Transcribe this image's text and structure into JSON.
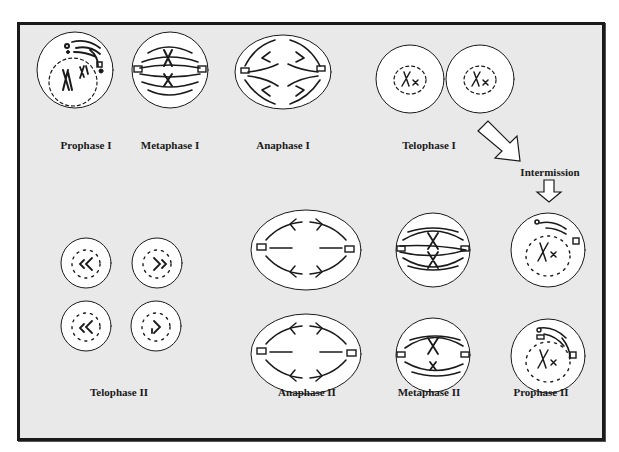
{
  "diagram": {
    "type": "process flow",
    "stages": [
      {
        "id": "prophase-1",
        "label": "Prophase I"
      },
      {
        "id": "metaphase-1",
        "label": "Metaphase I"
      },
      {
        "id": "anaphase-1",
        "label": "Anaphase I"
      },
      {
        "id": "telophase-1",
        "label": "Telophase I"
      },
      {
        "id": "intermission",
        "label": "Intermission"
      },
      {
        "id": "prophase-2",
        "label": "Prophase II"
      },
      {
        "id": "metaphase-2",
        "label": "Metaphase II"
      },
      {
        "id": "anaphase-2",
        "label": "Anaphase II"
      },
      {
        "id": "telophase-2",
        "label": "Telophase II"
      }
    ],
    "flow": [
      "Prophase I",
      "Metaphase I",
      "Anaphase I",
      "Telophase I",
      "Intermission",
      "Prophase II",
      "Metaphase II",
      "Anaphase II",
      "Telophase II"
    ],
    "colors": {
      "background": "#e9e9e9",
      "frame": "#1a1a1a",
      "cell_fill": "#ffffff",
      "ink": "#1a1a1a"
    }
  }
}
